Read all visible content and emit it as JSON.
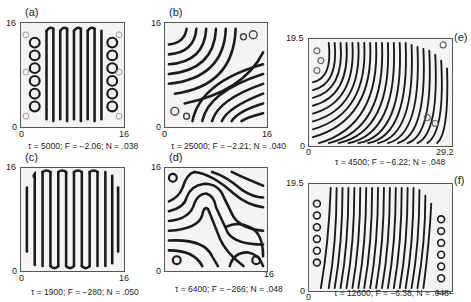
{
  "figure": {
    "panels": [
      {
        "id": "a",
        "label": "(a)",
        "x_min": "0",
        "x_max": "16",
        "y_min": "0",
        "y_max": "16",
        "caption": "τ = 5000; F = −2.06; N = .038",
        "pattern": "vertical stripes with edge rings"
      },
      {
        "id": "b",
        "label": "(b)",
        "x_min": "0",
        "x_max": "16",
        "y_min": "0",
        "y_max": "16",
        "caption": "τ = 25000; F = −2.21; N = .040",
        "pattern": "diagonal curved stripes"
      },
      {
        "id": "c",
        "label": "(c)",
        "x_min": "0",
        "x_max": "16",
        "y_min": "0",
        "y_max": "16",
        "caption": "τ = 1900; F = −280; N = .050",
        "pattern": "vertical stripes with edge-bent ends"
      },
      {
        "id": "d",
        "label": "(d)",
        "x_min": "0",
        "x_max": "16",
        "y_min": "0",
        "y_max": "16",
        "caption": "τ = 6400; F = −266; N = .048",
        "pattern": "labyrinthine stripes"
      },
      {
        "id": "e",
        "label": "(e)",
        "x_min": "0",
        "x_max": "29.2",
        "y_min": "0",
        "y_max": "19.5",
        "caption": "τ = 4500; F = −6.22; N = .048",
        "pattern": "fine curved stripes"
      },
      {
        "id": "f",
        "label": "(f)",
        "x_min": "0",
        "x_max": "29.2",
        "y_min": "0",
        "y_max": "19.5",
        "caption": "τ = 12600; F = −6.38; N = .048",
        "pattern": "fine slanted stripes with edge rings"
      }
    ]
  }
}
